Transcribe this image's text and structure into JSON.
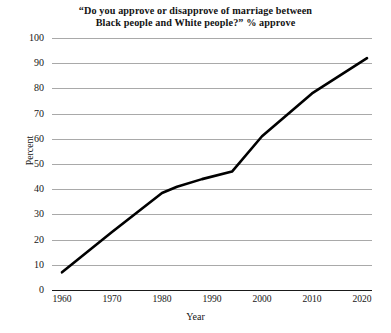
{
  "chart_data": {
    "type": "line",
    "title": "“Do you approve or disapprove of marriage between Black people and White people?” % approve",
    "title_line1": "“Do you approve or disapprove of marriage between",
    "title_line2": "Black people and White people?” % approve",
    "xlabel": "Year",
    "ylabel": "Percent",
    "xlim": [
      1958,
      2022
    ],
    "ylim": [
      0,
      100
    ],
    "grid": true,
    "legend": "none",
    "line_color": "#000000",
    "grid_color": "#a9a9a9",
    "axis_color": "#1a1a1a",
    "x_ticks": [
      "1960",
      "1970",
      "1980",
      "1990",
      "2000",
      "2010",
      "2020"
    ],
    "y_ticks": [
      "0",
      "10",
      "20",
      "30",
      "40",
      "50",
      "60",
      "70",
      "80",
      "90",
      "100"
    ],
    "series": [
      {
        "name": "% approve",
        "x": [
          1960,
          1970,
          1980,
          1983,
          1988,
          1994,
          2000,
          2010,
          2021
        ],
        "values": [
          7,
          23,
          38.5,
          41,
          44,
          47,
          61,
          78,
          92
        ]
      }
    ]
  }
}
